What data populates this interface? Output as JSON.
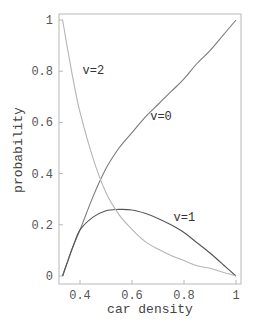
{
  "chart_data": {
    "type": "line",
    "title": "",
    "xlabel": "car density",
    "ylabel": "probability",
    "xlim": [
      0.333,
      1.0
    ],
    "ylim": [
      0,
      1
    ],
    "grid": false,
    "legend": "inline labels",
    "x_ticks": [
      {
        "value": 0.4,
        "label": "0.4"
      },
      {
        "value": 0.6,
        "label": "0.6"
      },
      {
        "value": 0.8,
        "label": "0.8"
      },
      {
        "value": 1.0,
        "label": "1"
      }
    ],
    "y_ticks": [
      {
        "value": 0,
        "label": "0"
      },
      {
        "value": 0.2,
        "label": "0.2"
      },
      {
        "value": 0.4,
        "label": "0.4"
      },
      {
        "value": 0.6,
        "label": "0.6"
      },
      {
        "value": 0.8,
        "label": "0.8"
      },
      {
        "value": 1.0,
        "label": "1"
      }
    ],
    "x": [
      0.333,
      0.35,
      0.375,
      0.4,
      0.45,
      0.5,
      0.55,
      0.6,
      0.65,
      0.7,
      0.75,
      0.8,
      0.85,
      0.9,
      0.95,
      1.0
    ],
    "series": [
      {
        "name": "v=0",
        "color": "#7a7a7a",
        "values": [
          0.0,
          0.05,
          0.12,
          0.18,
          0.31,
          0.42,
          0.5,
          0.56,
          0.62,
          0.67,
          0.72,
          0.77,
          0.83,
          0.88,
          0.94,
          1.0
        ]
      },
      {
        "name": "v=1",
        "color": "#555555",
        "values": [
          0.0,
          0.05,
          0.12,
          0.18,
          0.23,
          0.255,
          0.26,
          0.258,
          0.245,
          0.225,
          0.2,
          0.17,
          0.13,
          0.09,
          0.045,
          0.0
        ]
      },
      {
        "name": "v=2",
        "color": "#b5b5b5",
        "values": [
          1.0,
          0.9,
          0.76,
          0.64,
          0.46,
          0.325,
          0.24,
          0.182,
          0.135,
          0.105,
          0.08,
          0.06,
          0.04,
          0.03,
          0.015,
          0.0
        ]
      }
    ],
    "annotations": [
      {
        "text": "v=2",
        "x": 0.41,
        "y": 0.79
      },
      {
        "text": "v=0",
        "x": 0.67,
        "y": 0.61
      },
      {
        "text": "v=1",
        "x": 0.76,
        "y": 0.215
      }
    ]
  }
}
